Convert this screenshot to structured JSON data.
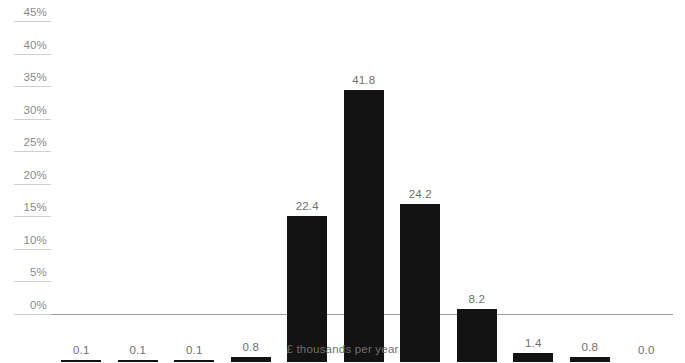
{
  "chart_data": {
    "type": "bar",
    "title": "",
    "subtitle": "",
    "xlabel": "£ thousands per year",
    "ylabel": "",
    "categories": [
      "6",
      "7",
      "8",
      "9",
      "10",
      "11",
      "12",
      "13",
      "14",
      "15",
      "16"
    ],
    "values": [
      0.1,
      0.1,
      0.1,
      0.8,
      22.4,
      41.8,
      24.2,
      8.2,
      1.4,
      0.8,
      0.0
    ],
    "data_labels": [
      "0.1",
      "0.1",
      "0.1",
      "0.8",
      "22.4",
      "41.8",
      "24.2",
      "8.2",
      "1.4",
      "0.8",
      "0.0"
    ],
    "ylim": [
      0,
      45
    ],
    "y_tick_values": [
      0,
      5,
      10,
      15,
      20,
      25,
      30,
      35,
      40,
      45
    ],
    "y_tick_labels": [
      "0%",
      "5%",
      "10%",
      "15%",
      "20%",
      "25%",
      "30%",
      "35%",
      "40%",
      "45%"
    ],
    "grid": "y-axis-label-stubs-only",
    "legend": "none",
    "bar_color": "#131313",
    "axis_color": "#9a9a9a",
    "grid_color": "#cfcfcf",
    "label_color": "#6f6f6f",
    "tick_color": "#7d7d7d",
    "background_color": "#ffffff"
  }
}
